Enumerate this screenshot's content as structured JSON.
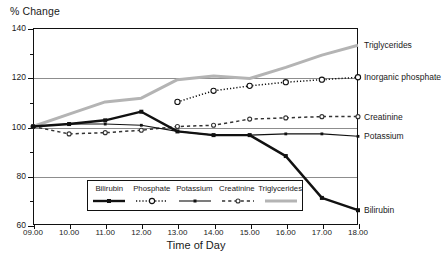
{
  "chart_data": {
    "type": "line",
    "title": "",
    "ylabel": "% Change",
    "xlabel": "Time of Day",
    "ylim": [
      60,
      140
    ],
    "ytick_major": [
      60,
      80,
      100,
      120,
      140
    ],
    "ytick_minor": [
      70,
      90,
      110,
      130
    ],
    "gridlines": [
      80,
      100,
      120
    ],
    "grid": true,
    "legend_position": "inside-bottom-center",
    "categories": [
      "09.00",
      "10.00",
      "11.00",
      "12.00",
      "13.00",
      "14.00",
      "15.00",
      "16.00",
      "17.00",
      "18.00"
    ],
    "series": [
      {
        "name": "Bilirubin",
        "style": "solid-thick",
        "marker": "filled-square",
        "color": "#111111",
        "values": [
          100,
          101,
          102.5,
          106,
          98,
          96.5,
          96.5,
          88,
          71,
          66
        ]
      },
      {
        "name": "Phosphate",
        "style": "dotted",
        "marker": "open-circle",
        "color": "#111111",
        "values": [
          null,
          null,
          null,
          null,
          110,
          114.5,
          116.5,
          118,
          119,
          120
        ]
      },
      {
        "name": "Potassium",
        "style": "solid-thin",
        "marker": "small-filled-square",
        "color": "#111111",
        "values": [
          100,
          101,
          101,
          100.5,
          98,
          96.5,
          96.5,
          97,
          97,
          96
        ]
      },
      {
        "name": "Creatinine",
        "style": "dashed",
        "marker": "open-circle-small",
        "color": "#333333",
        "values": [
          100,
          97,
          97.5,
          98.5,
          100,
          100.5,
          103,
          103.5,
          104,
          104
        ]
      },
      {
        "name": "Triglycerides",
        "style": "solid-thick-gray",
        "marker": "none",
        "color": "#b4b4b4",
        "values": [
          100,
          105,
          110,
          111.5,
          119,
          120.5,
          119.5,
          124,
          129,
          133
        ]
      }
    ],
    "right_labels": [
      {
        "text": "Triglycerides",
        "y_value": 133
      },
      {
        "text": "Inorganic phosphate",
        "y_value": 120
      },
      {
        "text": "Creatinine",
        "y_value": 104
      },
      {
        "text": "Potassium",
        "y_value": 96
      },
      {
        "text": "Bilirubin",
        "y_value": 66
      }
    ],
    "legend": {
      "entries": [
        "Bilirubin",
        "Phosphate",
        "Potassium",
        "Creatinine",
        "Triglycerides"
      ]
    }
  }
}
